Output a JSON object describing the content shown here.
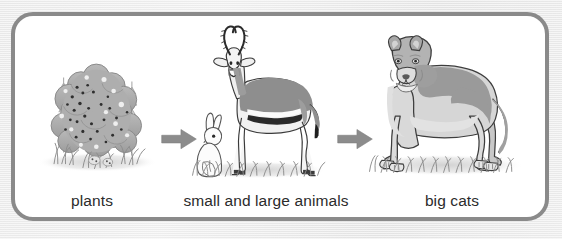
{
  "diagram": {
    "type": "food-chain",
    "title": "",
    "background_color": "#e9e9e9",
    "panel_color": "#ffffff",
    "border_color": "#8a8a8a",
    "arrow_color": "#8c8c8c",
    "stages": [
      {
        "id": "plants",
        "label": "plants",
        "illustration": "shrub-with-berries-and-grass",
        "icon_name": "bush-icon"
      },
      {
        "id": "small-and-large-animals",
        "label": "small and large animals",
        "illustration": "rabbit-and-gazelle-on-grass",
        "icon_name": "gazelle-icon"
      },
      {
        "id": "big-cats",
        "label": "big cats",
        "illustration": "lioness-on-grass",
        "icon_name": "lion-icon"
      }
    ],
    "arrows": [
      {
        "id": "arrow-plants-to-animals",
        "from": "plants",
        "to": "small-and-large-animals",
        "direction": "right"
      },
      {
        "id": "arrow-animals-to-bigcats",
        "from": "small-and-large-animals",
        "to": "big-cats",
        "direction": "right"
      }
    ]
  }
}
